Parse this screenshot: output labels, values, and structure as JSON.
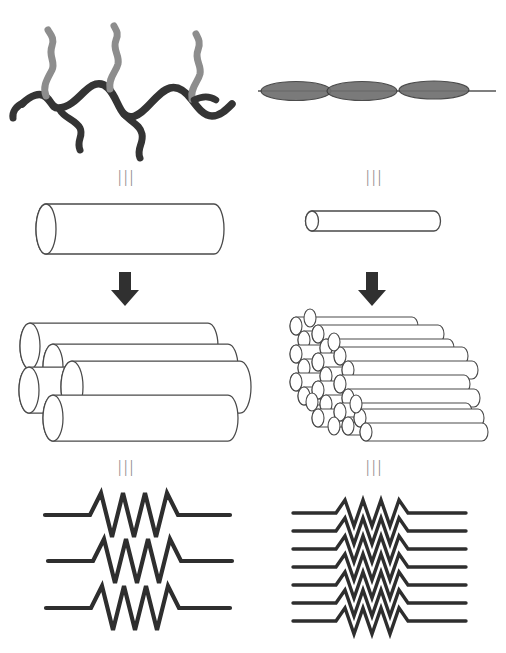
{
  "figure": {
    "background_color": "#ffffff",
    "ink_color": "#333333",
    "outline_color": "#444444",
    "equivalence_symbol": "|||",
    "arrow_symbol": "down-arrow"
  },
  "columns": [
    {
      "id": "left",
      "name": "side-chain-polymer-pathway",
      "rows": [
        {
          "id": "molecule",
          "name": "side-chain-polymer-molecule",
          "description": "Wavy branched polymer backbone with pendant side chains",
          "backbone_color": "#3a3a3a",
          "sidechain_color": "#8d8d8d",
          "repeat_units": 3
        },
        {
          "id": "equivalence-1",
          "name": "equivalence-symbol",
          "symbol": "|||"
        },
        {
          "id": "cylinder",
          "name": "thick-cylinder",
          "description": "Single fat cylinder representing the assembled column",
          "count": 1,
          "relative_diameter": "large"
        },
        {
          "id": "arrow",
          "name": "down-arrow",
          "symbol": "↓"
        },
        {
          "id": "bundle",
          "name": "thick-cylinder-bundle",
          "description": "Bundle of five fat cylinders in hexagonal packing",
          "count": 5
        },
        {
          "id": "equivalence-2",
          "name": "equivalence-symbol",
          "symbol": "|||"
        },
        {
          "id": "zigzag",
          "name": "large-amplitude-zigzag-stack",
          "description": "Three widely spaced zigzag (resistor-like) chains",
          "count": 3,
          "amplitude": "large",
          "teeth": 4
        }
      ]
    },
    {
      "id": "right",
      "name": "main-chain-mesogen-pathway",
      "rows": [
        {
          "id": "molecule",
          "name": "main-chain-mesogen-molecule",
          "description": "Three lens-shaped mesogens strung on a straight spacer line",
          "mesogen_fill": "#6a6a6a",
          "mesogen_count": 3
        },
        {
          "id": "equivalence-1",
          "name": "equivalence-symbol",
          "symbol": "|||"
        },
        {
          "id": "cylinder",
          "name": "thin-cylinder",
          "description": "Single slender cylinder representing the assembled column",
          "count": 1,
          "relative_diameter": "small"
        },
        {
          "id": "arrow",
          "name": "down-arrow",
          "symbol": "↓"
        },
        {
          "id": "bundle",
          "name": "thin-cylinder-bundle",
          "description": "Dense bundle of many slender cylinders in hexagonal packing",
          "count": 26
        },
        {
          "id": "equivalence-2",
          "name": "equivalence-symbol",
          "symbol": "|||"
        },
        {
          "id": "zigzag",
          "name": "small-amplitude-zigzag-stack",
          "description": "Seven closely spaced zigzag chains",
          "count": 7,
          "amplitude": "small",
          "teeth": 4
        }
      ]
    }
  ]
}
